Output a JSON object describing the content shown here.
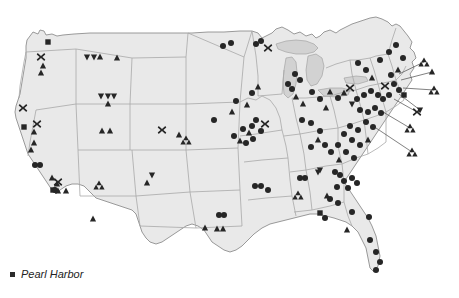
{
  "figure": {
    "type": "point-distribution-map",
    "region": "Contiguous United States",
    "background_color": "#ffffff",
    "land_fill": "#e9e9e9",
    "land_stroke": "#9a9a9a",
    "state_stroke": "#a8a8a8",
    "lake_fill": "#d5d5d5",
    "marker_color": "#262626",
    "leader_line_color": "#4a4a4a"
  },
  "legend": {
    "swatch_shape": "square",
    "swatch_color": "#2b2b2b",
    "label": "Pearl Harbor"
  },
  "marker_shapes": {
    "triangle": "triangle-up-marker",
    "inverted_triangle": "triangle-down-marker",
    "cross": "x-marker",
    "square": "square-marker",
    "circle": "circle-marker",
    "trefoil": "trefoil-cluster-marker"
  },
  "chart_data": {
    "type": "scatter",
    "title": "",
    "xlabel": "",
    "ylabel": "",
    "projection": "albers-usa",
    "counts": {
      "triangle": 74,
      "inverted_triangle": 12,
      "cross": 10,
      "square": 5,
      "circle": 96,
      "trefoil": 9,
      "callout_leader_lines": 7,
      "total_markers": 206
    },
    "markers": [
      {
        "shape": "square",
        "x": 48,
        "y": 42
      },
      {
        "shape": "cross",
        "x": 41,
        "y": 57
      },
      {
        "shape": "triangle",
        "x": 43,
        "y": 66
      },
      {
        "shape": "triangle",
        "x": 41,
        "y": 73
      },
      {
        "shape": "inverted_triangle",
        "x": 87,
        "y": 57
      },
      {
        "shape": "inverted_triangle",
        "x": 94,
        "y": 57
      },
      {
        "shape": "triangle",
        "x": 100,
        "y": 57
      },
      {
        "shape": "triangle",
        "x": 117,
        "y": 58
      },
      {
        "shape": "inverted_triangle",
        "x": 101,
        "y": 96
      },
      {
        "shape": "inverted_triangle",
        "x": 108,
        "y": 96
      },
      {
        "shape": "inverted_triangle",
        "x": 114,
        "y": 96
      },
      {
        "shape": "triangle",
        "x": 108,
        "y": 104
      },
      {
        "shape": "triangle",
        "x": 102,
        "y": 131
      },
      {
        "shape": "triangle",
        "x": 110,
        "y": 131
      },
      {
        "shape": "cross",
        "x": 23,
        "y": 108
      },
      {
        "shape": "square",
        "x": 24,
        "y": 127
      },
      {
        "shape": "cross",
        "x": 37,
        "y": 124
      },
      {
        "shape": "triangle",
        "x": 34,
        "y": 132
      },
      {
        "shape": "triangle",
        "x": 34,
        "y": 143
      },
      {
        "shape": "triangle",
        "x": 31,
        "y": 150
      },
      {
        "shape": "circle",
        "x": 35,
        "y": 165
      },
      {
        "shape": "circle",
        "x": 40,
        "y": 165
      },
      {
        "shape": "triangle",
        "x": 52,
        "y": 178
      },
      {
        "shape": "triangle",
        "x": 57,
        "y": 184
      },
      {
        "shape": "square",
        "x": 53,
        "y": 190
      },
      {
        "shape": "circle",
        "x": 55,
        "y": 190
      },
      {
        "shape": "cross",
        "x": 58,
        "y": 182
      },
      {
        "shape": "triangle",
        "x": 58,
        "y": 191
      },
      {
        "shape": "triangle",
        "x": 66,
        "y": 191
      },
      {
        "shape": "trefoil",
        "x": 99,
        "y": 185
      },
      {
        "shape": "trefoil",
        "x": 186,
        "y": 140
      },
      {
        "shape": "inverted_triangle",
        "x": 152,
        "y": 175
      },
      {
        "shape": "triangle",
        "x": 147,
        "y": 183
      },
      {
        "shape": "triangle",
        "x": 93,
        "y": 219
      },
      {
        "shape": "triangle",
        "x": 205,
        "y": 228
      },
      {
        "shape": "circle",
        "x": 219,
        "y": 215
      },
      {
        "shape": "circle",
        "x": 224,
        "y": 215
      },
      {
        "shape": "triangle",
        "x": 217,
        "y": 229
      },
      {
        "shape": "triangle",
        "x": 223,
        "y": 229
      },
      {
        "shape": "cross",
        "x": 162,
        "y": 130
      },
      {
        "shape": "triangle",
        "x": 179,
        "y": 135
      },
      {
        "shape": "circle",
        "x": 214,
        "y": 120
      },
      {
        "shape": "triangle",
        "x": 232,
        "y": 112
      },
      {
        "shape": "circle",
        "x": 236,
        "y": 101
      },
      {
        "shape": "triangle",
        "x": 247,
        "y": 105
      },
      {
        "shape": "triangle",
        "x": 258,
        "y": 87
      },
      {
        "shape": "circle",
        "x": 252,
        "y": 93
      },
      {
        "shape": "circle",
        "x": 243,
        "y": 129
      },
      {
        "shape": "circle",
        "x": 252,
        "y": 126
      },
      {
        "shape": "triangle",
        "x": 249,
        "y": 133
      },
      {
        "shape": "circle",
        "x": 256,
        "y": 120
      },
      {
        "shape": "cross",
        "x": 265,
        "y": 124
      },
      {
        "shape": "circle",
        "x": 261,
        "y": 131
      },
      {
        "shape": "circle",
        "x": 253,
        "y": 139
      },
      {
        "shape": "circle",
        "x": 246,
        "y": 143
      },
      {
        "shape": "triangle",
        "x": 240,
        "y": 141
      },
      {
        "shape": "circle",
        "x": 234,
        "y": 136
      },
      {
        "shape": "cross",
        "x": 268,
        "y": 48
      },
      {
        "shape": "circle",
        "x": 256,
        "y": 44
      },
      {
        "shape": "circle",
        "x": 261,
        "y": 41
      },
      {
        "shape": "circle",
        "x": 223,
        "y": 46
      },
      {
        "shape": "circle",
        "x": 231,
        "y": 43
      },
      {
        "shape": "circle",
        "x": 288,
        "y": 84
      },
      {
        "shape": "circle",
        "x": 292,
        "y": 89
      },
      {
        "shape": "triangle",
        "x": 296,
        "y": 97
      },
      {
        "shape": "triangle",
        "x": 303,
        "y": 104
      },
      {
        "shape": "circle",
        "x": 312,
        "y": 92
      },
      {
        "shape": "circle",
        "x": 320,
        "y": 99
      },
      {
        "shape": "triangle",
        "x": 326,
        "y": 108
      },
      {
        "shape": "triangle",
        "x": 330,
        "y": 92
      },
      {
        "shape": "circle",
        "x": 300,
        "y": 80
      },
      {
        "shape": "circle",
        "x": 295,
        "y": 74
      },
      {
        "shape": "circle",
        "x": 302,
        "y": 120
      },
      {
        "shape": "circle",
        "x": 311,
        "y": 123
      },
      {
        "shape": "circle",
        "x": 320,
        "y": 131
      },
      {
        "shape": "inverted_triangle",
        "x": 320,
        "y": 170
      },
      {
        "shape": "circle",
        "x": 300,
        "y": 178
      },
      {
        "shape": "circle",
        "x": 305,
        "y": 178
      },
      {
        "shape": "circle",
        "x": 255,
        "y": 186
      },
      {
        "shape": "circle",
        "x": 261,
        "y": 186
      },
      {
        "shape": "circle",
        "x": 268,
        "y": 190
      },
      {
        "shape": "trefoil",
        "x": 298,
        "y": 195
      },
      {
        "shape": "triangle",
        "x": 327,
        "y": 196
      },
      {
        "shape": "inverted_triangle",
        "x": 318,
        "y": 172
      },
      {
        "shape": "circle",
        "x": 335,
        "y": 172
      },
      {
        "shape": "circle",
        "x": 340,
        "y": 175
      },
      {
        "shape": "circle",
        "x": 344,
        "y": 181
      },
      {
        "shape": "circle",
        "x": 337,
        "y": 187
      },
      {
        "shape": "circle",
        "x": 348,
        "y": 188
      },
      {
        "shape": "circle",
        "x": 352,
        "y": 178
      },
      {
        "shape": "circle",
        "x": 357,
        "y": 183
      },
      {
        "shape": "circle",
        "x": 330,
        "y": 199
      },
      {
        "shape": "circle",
        "x": 338,
        "y": 203
      },
      {
        "shape": "square",
        "x": 320,
        "y": 213
      },
      {
        "shape": "circle",
        "x": 325,
        "y": 218
      },
      {
        "shape": "circle",
        "x": 352,
        "y": 212
      },
      {
        "shape": "triangle",
        "x": 347,
        "y": 230
      },
      {
        "shape": "circle",
        "x": 370,
        "y": 240
      },
      {
        "shape": "circle",
        "x": 376,
        "y": 252
      },
      {
        "shape": "circle",
        "x": 380,
        "y": 262
      },
      {
        "shape": "circle",
        "x": 376,
        "y": 270
      },
      {
        "shape": "circle",
        "x": 369,
        "y": 217
      },
      {
        "shape": "circle",
        "x": 358,
        "y": 63
      },
      {
        "shape": "circle",
        "x": 366,
        "y": 70
      },
      {
        "shape": "triangle",
        "x": 372,
        "y": 78
      },
      {
        "shape": "circle",
        "x": 380,
        "y": 60
      },
      {
        "shape": "circle",
        "x": 389,
        "y": 52
      },
      {
        "shape": "circle",
        "x": 396,
        "y": 45
      },
      {
        "shape": "circle",
        "x": 403,
        "y": 58
      },
      {
        "shape": "triangle",
        "x": 398,
        "y": 70
      },
      {
        "shape": "circle",
        "x": 391,
        "y": 75
      },
      {
        "shape": "cross",
        "x": 385,
        "y": 86
      },
      {
        "shape": "circle",
        "x": 394,
        "y": 84
      },
      {
        "shape": "circle",
        "x": 399,
        "y": 90
      },
      {
        "shape": "square",
        "x": 404,
        "y": 95
      },
      {
        "shape": "circle",
        "x": 389,
        "y": 95
      },
      {
        "shape": "circle",
        "x": 383,
        "y": 99
      },
      {
        "shape": "circle",
        "x": 378,
        "y": 95
      },
      {
        "shape": "circle",
        "x": 371,
        "y": 91
      },
      {
        "shape": "circle",
        "x": 364,
        "y": 95
      },
      {
        "shape": "circle",
        "x": 357,
        "y": 99
      },
      {
        "shape": "cross",
        "x": 350,
        "y": 88
      },
      {
        "shape": "triangle",
        "x": 344,
        "y": 93
      },
      {
        "shape": "circle",
        "x": 338,
        "y": 98
      },
      {
        "shape": "inverted_triangle",
        "x": 352,
        "y": 104
      },
      {
        "shape": "circle",
        "x": 360,
        "y": 110
      },
      {
        "shape": "circle",
        "x": 368,
        "y": 112
      },
      {
        "shape": "circle",
        "x": 375,
        "y": 108
      },
      {
        "shape": "circle",
        "x": 381,
        "y": 113
      },
      {
        "shape": "circle",
        "x": 366,
        "y": 122
      },
      {
        "shape": "circle",
        "x": 373,
        "y": 127
      },
      {
        "shape": "circle",
        "x": 358,
        "y": 130
      },
      {
        "shape": "circle",
        "x": 350,
        "y": 126
      },
      {
        "shape": "circle",
        "x": 344,
        "y": 134
      },
      {
        "shape": "circle",
        "x": 352,
        "y": 140
      },
      {
        "shape": "circle",
        "x": 360,
        "y": 145
      },
      {
        "shape": "triangle",
        "x": 368,
        "y": 140
      },
      {
        "shape": "circle",
        "x": 338,
        "y": 145
      },
      {
        "shape": "circle",
        "x": 346,
        "y": 152
      },
      {
        "shape": "circle",
        "x": 354,
        "y": 158
      },
      {
        "shape": "triangle",
        "x": 339,
        "y": 160
      },
      {
        "shape": "circle",
        "x": 331,
        "y": 152
      },
      {
        "shape": "circle",
        "x": 325,
        "y": 145
      },
      {
        "shape": "triangle",
        "x": 318,
        "y": 140
      },
      {
        "shape": "circle",
        "x": 311,
        "y": 147
      }
    ],
    "callouts": [
      {
        "from_x": 399,
        "from_y": 74,
        "to_x": 424,
        "to_y": 62,
        "marker": "trefoil"
      },
      {
        "from_x": 401,
        "from_y": 80,
        "to_x": 432,
        "to_y": 72,
        "marker": "triangle"
      },
      {
        "from_x": 403,
        "from_y": 88,
        "to_x": 434,
        "to_y": 90,
        "marker": "trefoil"
      },
      {
        "from_x": 399,
        "from_y": 94,
        "to_x": 420,
        "to_y": 110,
        "marker": "inverted_triangle"
      },
      {
        "from_x": 394,
        "from_y": 99,
        "to_x": 417,
        "to_y": 112,
        "marker": "cross"
      },
      {
        "from_x": 383,
        "from_y": 112,
        "to_x": 410,
        "to_y": 128,
        "marker": "trefoil"
      },
      {
        "from_x": 376,
        "from_y": 128,
        "to_x": 412,
        "to_y": 152,
        "marker": "trefoil"
      }
    ]
  }
}
